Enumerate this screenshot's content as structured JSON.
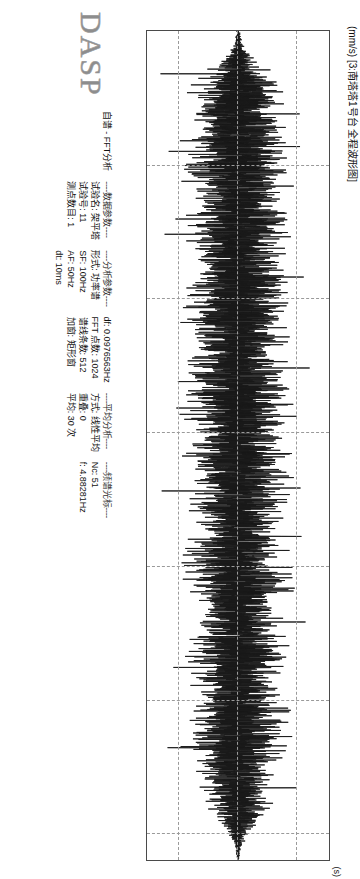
{
  "brand": "DASP",
  "header": {
    "app_title": "自谱 - FFT分析",
    "section_data_params": "----数据参数----",
    "section_analysis_params": "----分析参数----",
    "section_average_analysis": "----平均分析----",
    "section_spectrum_cursor": "----频谱光标----",
    "params": [
      {
        "label": "试验名:",
        "value": "架平塔"
      },
      {
        "label": "试验号:",
        "value": "11"
      },
      {
        "label": "测点数目:",
        "value": "1"
      },
      {
        "label": "形式:",
        "value": "功率谱"
      },
      {
        "label": "SF:",
        "value": "100Hz"
      },
      {
        "label": "AF:",
        "value": "50Hz"
      },
      {
        "label": "dt:",
        "value": "10ms"
      },
      {
        "label": "df:",
        "value": "0.0976563Hz"
      },
      {
        "label": "FFT 点数:",
        "value": "1024"
      },
      {
        "label": "谱线条数:",
        "value": "512"
      },
      {
        "label": "加窗:",
        "value": "矩形窗"
      },
      {
        "label": "方式:",
        "value": "线性平均"
      },
      {
        "label": "重叠:",
        "value": "0"
      },
      {
        "label": "平均:",
        "value": "30 次"
      },
      {
        "label": "Nc:",
        "value": "51"
      },
      {
        "label": "f:",
        "value": "4.88281Hz"
      }
    ]
  },
  "chart_data": {
    "type": "line",
    "title": "(mm/s) [3:南塔塔1号台 全程波形图]",
    "xlabel": "(s)",
    "ylabel": "(mm/s)",
    "x_unit": "(s)",
    "y_unit": "(mm/s)",
    "channel_label": "[3:南塔塔1号台 全程波形图]",
    "xlim": [
      0,
      310
    ],
    "ylim": [
      -1.55,
      1.55
    ],
    "x_ticks": [
      0,
      50,
      100,
      150,
      200,
      250,
      300
    ],
    "x_tick_labels": [
      "0",
      "50",
      "100",
      "150",
      "200",
      "250",
      "300"
    ],
    "y_ticks": [
      -1,
      0,
      1
    ],
    "y_tick_labels": [
      "-1",
      "0",
      "1"
    ],
    "grid": true,
    "grid_style": "dashed",
    "legend": null,
    "series": [
      {
        "name": "3:南塔塔1号台 全程波形图",
        "color": "#1a1a1a",
        "description": "Dense broadband random vibration time history oscillating about zero; envelope rises from ~0 at t=0 to roughly +/-0.6 mm/s through the 20-290 s window with scattered transient spikes reaching +/-1.3 mm/s.",
        "sample_rate_hz": 100,
        "duration_s": 310,
        "envelope_points": [
          {
            "t": 0,
            "amp": 0.02
          },
          {
            "t": 6,
            "amp": 0.06
          },
          {
            "t": 12,
            "amp": 0.22
          },
          {
            "t": 18,
            "amp": 0.4
          },
          {
            "t": 24,
            "amp": 0.5
          },
          {
            "t": 32,
            "amp": 0.46
          },
          {
            "t": 40,
            "amp": 0.55
          },
          {
            "t": 48,
            "amp": 0.62
          },
          {
            "t": 56,
            "amp": 0.52
          },
          {
            "t": 64,
            "amp": 0.48
          },
          {
            "t": 72,
            "amp": 0.58
          },
          {
            "t": 80,
            "amp": 0.5
          },
          {
            "t": 88,
            "amp": 0.44
          },
          {
            "t": 96,
            "amp": 0.56
          },
          {
            "t": 104,
            "amp": 0.6
          },
          {
            "t": 112,
            "amp": 0.5
          },
          {
            "t": 120,
            "amp": 0.46
          },
          {
            "t": 128,
            "amp": 0.54
          },
          {
            "t": 136,
            "amp": 0.62
          },
          {
            "t": 144,
            "amp": 0.56
          },
          {
            "t": 152,
            "amp": 0.48
          },
          {
            "t": 160,
            "amp": 0.52
          },
          {
            "t": 168,
            "amp": 0.6
          },
          {
            "t": 176,
            "amp": 0.54
          },
          {
            "t": 184,
            "amp": 0.46
          },
          {
            "t": 192,
            "amp": 0.5
          },
          {
            "t": 200,
            "amp": 0.58
          },
          {
            "t": 208,
            "amp": 0.52
          },
          {
            "t": 216,
            "amp": 0.44
          },
          {
            "t": 224,
            "amp": 0.5
          },
          {
            "t": 232,
            "amp": 0.56
          },
          {
            "t": 240,
            "amp": 0.48
          },
          {
            "t": 248,
            "amp": 0.42
          },
          {
            "t": 256,
            "amp": 0.5
          },
          {
            "t": 264,
            "amp": 0.54
          },
          {
            "t": 272,
            "amp": 0.46
          },
          {
            "t": 280,
            "amp": 0.4
          },
          {
            "t": 288,
            "amp": 0.34
          },
          {
            "t": 294,
            "amp": 0.26
          },
          {
            "t": 300,
            "amp": 0.12
          },
          {
            "t": 305,
            "amp": 0.04
          },
          {
            "t": 310,
            "amp": 0.01
          }
        ],
        "transient_spikes": [
          {
            "t": 16,
            "value": -1.32
          },
          {
            "t": 31,
            "value": 1.05
          },
          {
            "t": 45,
            "value": -1.18
          },
          {
            "t": 58,
            "value": 0.95
          },
          {
            "t": 76,
            "value": -1.25
          },
          {
            "t": 92,
            "value": 1.12
          },
          {
            "t": 109,
            "value": -0.98
          },
          {
            "t": 126,
            "value": 1.22
          },
          {
            "t": 141,
            "value": -1.05
          },
          {
            "t": 158,
            "value": 0.92
          },
          {
            "t": 172,
            "value": -1.3
          },
          {
            "t": 189,
            "value": 1.08
          },
          {
            "t": 205,
            "value": -0.94
          },
          {
            "t": 221,
            "value": 1.15
          },
          {
            "t": 238,
            "value": -1.1
          },
          {
            "t": 254,
            "value": 0.9
          },
          {
            "t": 268,
            "value": -1.2
          },
          {
            "t": 283,
            "value": 1.0
          }
        ]
      }
    ]
  }
}
